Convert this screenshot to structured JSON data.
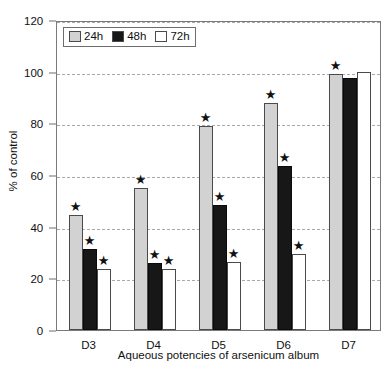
{
  "chart_data": {
    "type": "bar",
    "title": "",
    "xlabel": "Aqueous potencies of arsenicum album",
    "ylabel": "% of control",
    "categories": [
      "D3",
      "D4",
      "D5",
      "D6",
      "D7"
    ],
    "ylim": [
      0,
      120
    ],
    "ytick_labels": [
      "0",
      "20",
      "40",
      "60",
      "80",
      "100",
      "120"
    ],
    "ytick_values": [
      0,
      20,
      40,
      60,
      80,
      100,
      120
    ],
    "grid": "horizontal-dashed",
    "legend_position": "top-left-inside",
    "series": [
      {
        "name": "24h",
        "color": "#d2d2d2",
        "values": [
          44.5,
          55.0,
          79.0,
          88.0,
          99.0
        ],
        "significance": [
          "*",
          "*",
          "*",
          "*",
          "*"
        ]
      },
      {
        "name": "48h",
        "color": "#171717",
        "values": [
          31.5,
          26.0,
          48.5,
          63.5,
          97.5
        ],
        "significance": [
          "*",
          "*",
          "*",
          "*",
          ""
        ]
      },
      {
        "name": "72h",
        "color": "#ffffff",
        "values": [
          23.5,
          23.5,
          26.5,
          29.5,
          100.0
        ],
        "significance": [
          "*",
          "*",
          "*",
          "*",
          ""
        ]
      }
    ],
    "annotations": {
      "symbol": "★",
      "note_d7": "single significance marker centred above the D7 group"
    }
  },
  "legend": {
    "items": [
      {
        "label": "24h",
        "swatch": "gray-swatch"
      },
      {
        "label": "48h",
        "swatch": "black-swatch"
      },
      {
        "label": "72h",
        "swatch": "white-swatch"
      }
    ]
  },
  "axes": {
    "y_title": "% of control",
    "x_title": "Aqueous potencies of arsenicum album"
  }
}
